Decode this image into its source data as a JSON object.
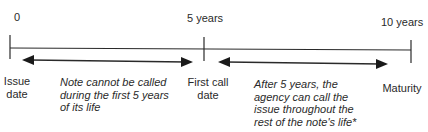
{
  "timeline": {
    "ticks": [
      {
        "label": "0",
        "caption_line1": "Issue",
        "caption_line2": "date"
      },
      {
        "label": "5 years",
        "caption_line1": "First call",
        "caption_line2": "date"
      },
      {
        "label": "10 years",
        "caption_line1": "Maturity",
        "caption_line2": ""
      }
    ],
    "periods": [
      {
        "lines": [
          "Note cannot be called",
          "during the first 5 years",
          "of its life"
        ]
      },
      {
        "lines": [
          "After 5 years, the",
          "agency can call the",
          "issue throughout the",
          "rest of the note's life*"
        ]
      }
    ]
  },
  "colors": {
    "line": "#2a2a2a",
    "text": "#2a2a2a",
    "background": "#ffffff"
  }
}
